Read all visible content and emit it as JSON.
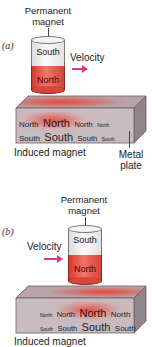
{
  "panel_a": {
    "letter": "(a)",
    "magnet_label_line1": "Permanent",
    "magnet_label_line2": "magnet",
    "magnet_top_pole": "South",
    "magnet_bottom_pole": "North",
    "velocity_label": "Velocity",
    "plate_row_north": [
      "North",
      "North",
      "North",
      "North"
    ],
    "plate_row_south": [
      "South",
      "South",
      "South",
      "South"
    ],
    "induced_label": "Induced magnet",
    "plate_label_line1": "Metal",
    "plate_label_line2": "plate"
  },
  "panel_b": {
    "letter": "(b)",
    "magnet_label_line1": "Permanent",
    "magnet_label_line2": "magnet",
    "magnet_top_pole": "South",
    "magnet_bottom_pole": "North",
    "velocity_label": "Velocity",
    "plate_row_north": [
      "North",
      "North",
      "North",
      "North"
    ],
    "plate_row_south": [
      "South",
      "South",
      "South",
      "South"
    ],
    "induced_label": "Induced magnet"
  },
  "colors": {
    "magnet_north": "#e0483c",
    "magnet_south": "#f2f2f2",
    "velocity_arrow": "#d23a86",
    "plate_base": "#b9a9ad",
    "plate_glow": "#e8463a"
  }
}
